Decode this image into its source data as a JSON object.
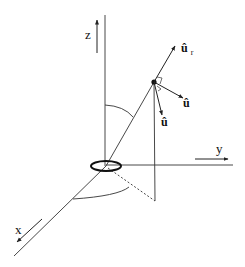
{
  "diagram": {
    "colors": {
      "stroke": "#222222",
      "background": "#ffffff"
    },
    "axes": {
      "x": {
        "label": "x"
      },
      "y": {
        "label": "y"
      },
      "z": {
        "label": "z"
      }
    },
    "unit_vectors": {
      "r": {
        "symbol": "û",
        "subscript": "r"
      },
      "phi": {
        "symbol": "û",
        "subscript": ""
      },
      "theta": {
        "symbol": "û",
        "subscript": ""
      }
    },
    "elements": [
      "origin-current-loop",
      "point-P",
      "theta-arc",
      "phi-arc",
      "projection-dashed-line",
      "vertical-drop-line"
    ]
  }
}
